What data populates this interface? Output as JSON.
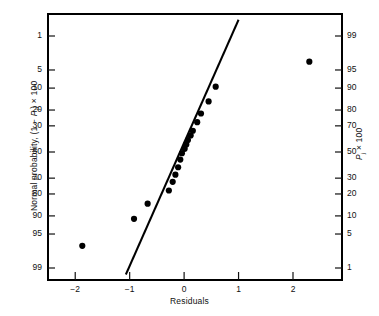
{
  "chart_data": {
    "type": "scatter",
    "title": "",
    "subtitle": "",
    "xlabel": "Residuals",
    "ylabel_left": "Normal probability, (1 − Pⱼ) × 100",
    "ylabel_right": "Pⱼ × 100",
    "xlim": [
      -2.5,
      2.9
    ],
    "xticks": [
      -2,
      -1,
      0,
      1,
      2
    ],
    "xticklabels": [
      "−2",
      "−1",
      "0",
      "1",
      "2"
    ],
    "left_axis": {
      "label": "Normal probability, (1 − Pⱼ) × 100",
      "ticks": [
        1,
        5,
        10,
        20,
        30,
        50,
        70,
        80,
        90,
        95,
        99
      ],
      "ticklabels": [
        "1",
        "5",
        "10",
        "20",
        "30",
        "50",
        "70",
        "80",
        "90",
        "95",
        "99"
      ],
      "scale": "normal-probability",
      "direction": "increasing-downward"
    },
    "right_axis": {
      "label": "Pⱼ × 100",
      "ticks": [
        99,
        95,
        90,
        80,
        70,
        50,
        30,
        20,
        10,
        5,
        1
      ],
      "ticklabels": [
        "99",
        "95",
        "90",
        "80",
        "70",
        "50",
        "30",
        "20",
        "10",
        "5",
        "1"
      ],
      "scale": "normal-probability",
      "direction": "decreasing-downward"
    },
    "grid": false,
    "legend": false,
    "series": [
      {
        "name": "residual quantiles",
        "marker": "filled-circle",
        "color": "#000000",
        "points": [
          {
            "x": -1.87,
            "p_right": 3.0
          },
          {
            "x": -0.92,
            "p_right": 9.0
          },
          {
            "x": -0.67,
            "p_right": 15.0
          },
          {
            "x": -0.28,
            "p_right": 22.0
          },
          {
            "x": -0.21,
            "p_right": 27.5
          },
          {
            "x": -0.16,
            "p_right": 32.5
          },
          {
            "x": -0.11,
            "p_right": 38.0
          },
          {
            "x": -0.07,
            "p_right": 44.0
          },
          {
            "x": -0.04,
            "p_right": 49.0
          },
          {
            "x": 0.01,
            "p_right": 52.5
          },
          {
            "x": 0.04,
            "p_right": 56.0
          },
          {
            "x": 0.07,
            "p_right": 59.5
          },
          {
            "x": 0.12,
            "p_right": 63.0
          },
          {
            "x": 0.16,
            "p_right": 66.5
          },
          {
            "x": 0.24,
            "p_right": 72.5
          },
          {
            "x": 0.31,
            "p_right": 78.0
          },
          {
            "x": 0.45,
            "p_right": 84.5
          },
          {
            "x": 0.58,
            "p_right": 90.5
          },
          {
            "x": 2.3,
            "p_right": 96.5
          }
        ]
      }
    ],
    "reference_line": {
      "name": "fitted normal line",
      "color": "#000000",
      "x_start": -1.07,
      "p_right_start": 0.7,
      "x_end": 1.0,
      "p_right_end": 99.6
    },
    "frame": {
      "color": "#000000",
      "left_spine": true,
      "right_spine": true,
      "top_spine": true,
      "bottom_spine": true
    }
  },
  "labels": {
    "xlabel": "Residuals",
    "ylabel_left": "Normal probability, (1 − Pⱼ) × 100",
    "ylabel_right": "Pⱼ × 100"
  }
}
